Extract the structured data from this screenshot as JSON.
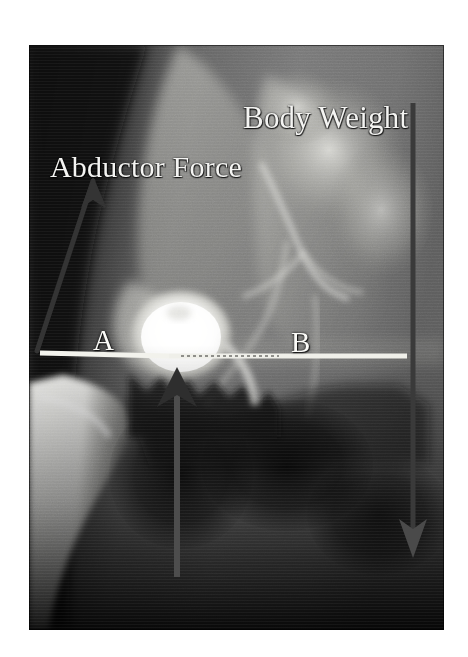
{
  "figure": {
    "kind": "radiograph-annotated",
    "modality": "x-ray",
    "view": "anteroposterior-pelvis-hip",
    "background_color": "#ffffff",
    "plate": {
      "left": 29,
      "top": 45,
      "width": 415,
      "height": 585,
      "dark_color": "#0b0b0b",
      "mid_color": "#7d7d7d",
      "bright_color": "#f2f2ef"
    }
  },
  "labels": {
    "body_weight": "Body Weight",
    "abductor_force": "Abductor Force",
    "joint_reactive_force": "Joint Reactive Force",
    "lever_arm_a": "A",
    "lever_arm_b": "B",
    "text_color": "#f4f4f2"
  },
  "vectors": [
    {
      "name": "abductor-force-vector",
      "label": "Abductor Force",
      "direction": "up-and-lateral",
      "color": "#3b3b3b",
      "tail": {
        "x": 8,
        "y": 305
      },
      "head": {
        "x": 65,
        "y": 133
      },
      "arrowhead": "start-of-line-top",
      "stroke_width": 4
    },
    {
      "name": "body-weight-vector",
      "label": "Body Weight",
      "direction": "down",
      "color": "#3a3a3a",
      "tail": {
        "x": 384,
        "y": 58
      },
      "head": {
        "x": 384,
        "y": 506
      },
      "arrowhead": "bottom",
      "stroke_width": 4
    },
    {
      "name": "joint-reactive-force-vector",
      "label": "Joint Reactive Force",
      "direction": "up",
      "color": "#4a4a4a",
      "tail": {
        "x": 148,
        "y": 530
      },
      "head": {
        "x": 148,
        "y": 327
      },
      "arrowhead": "top",
      "stroke_width": 5
    }
  ],
  "reference_line": {
    "name": "lever-arm-baseline",
    "description": "horizontal interteardrop / lever-arm reference line",
    "color": "#efefe9",
    "x_start": 11,
    "x_end": 378,
    "y": 310,
    "stroke_width": 4,
    "fulcrum_x": 148
  },
  "anatomy": [
    {
      "name": "femoral-head-prosthesis",
      "tone": "bright",
      "cx": 152,
      "cy": 290,
      "rx": 46,
      "ry": 40
    },
    {
      "name": "femoral-stem-shaft",
      "tone": "bright",
      "region": "left-inferior"
    },
    {
      "name": "iliac-wing",
      "tone": "mid",
      "region": "upper-center"
    },
    {
      "name": "sacroiliac-region",
      "tone": "mid-bright",
      "region": "upper-right"
    },
    {
      "name": "pubic-ramus",
      "tone": "dark",
      "region": "lower-center"
    },
    {
      "name": "obturator-foramen",
      "tone": "very-dark",
      "region": "lower-center-right"
    },
    {
      "name": "soft-tissue-background",
      "tone": "dark",
      "region": "left"
    }
  ]
}
